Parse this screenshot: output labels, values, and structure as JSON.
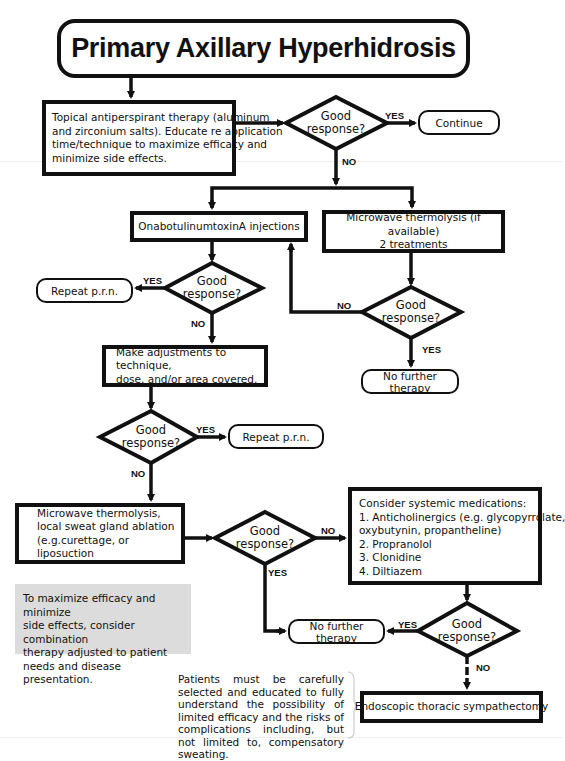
{
  "title": "Primary Axillary Hyperhidrosis",
  "decision_label": "Good response?",
  "decision_lines": [
    "Good",
    "response?"
  ],
  "edge_labels": {
    "yes": "YES",
    "no": "NO"
  },
  "nodes": {
    "topical": [
      "Topical antiperspirant therapy (aluminum",
      "and zirconium salts). Educate re application",
      "time/technique to maximize efficacy and",
      "minimize side effects."
    ],
    "continue": "Continue",
    "onabotulinum": "OnabotulinumtoxinA injections",
    "microwave_first": [
      "Microwave thermolysis (if available)",
      "2 treatments"
    ],
    "repeat_1": "Repeat p.r.n.",
    "repeat_2": "Repeat p.r.n.",
    "no_further_1": "No further therapy",
    "no_further_2": "No further therapy",
    "adjust": [
      "Make adjustments to technique,",
      "dose, and/or area covered."
    ],
    "microwave_local": [
      "Microwave thermolysis,",
      "local sweat gland ablation",
      "(e.g.curettage, or liposuction"
    ],
    "systemic": [
      "Consider systemic medications:",
      "1. Anticholinergics (e.g. glycopyrrolate,",
      "oxybutynin, propantheline)",
      "2. Propranolol",
      "3. Clonidine",
      "4. Diltiazem"
    ],
    "ets": "Endoscopic thoracic sympathectomy"
  },
  "notes": {
    "combination": [
      "To maximize efficacy and minimize",
      "side effects, consider combination",
      "therapy adjusted to patient",
      "needs and disease presentation."
    ],
    "patient_selection": "Patients must be carefully selected and educated to fully understand the possibility of limited efficacy and the risks of complications including, but not limited to, compensatory sweating."
  },
  "colors": {
    "line": "#111111",
    "note_bg": "#dcdcdc",
    "background": "#ffffff"
  }
}
